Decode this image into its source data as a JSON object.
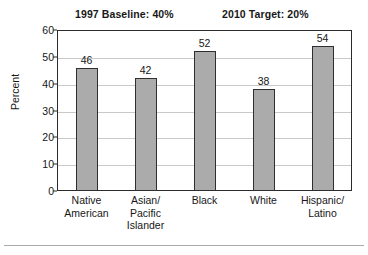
{
  "headers": {
    "baseline": "1997 Baseline: 40%",
    "target": "2010 Target: 20%"
  },
  "axis": {
    "ylabel": "Percent",
    "yticks": [
      "0",
      "10",
      "20",
      "30",
      "40",
      "50",
      "60"
    ]
  },
  "chart_data": {
    "type": "bar",
    "title": "",
    "subtitle": "",
    "annotations": [
      "1997 Baseline: 40%",
      "2010 Target: 20%"
    ],
    "categories": [
      "Native American",
      "Asian/ Pacific Islander",
      "Black",
      "White",
      "Hispanic/ Latino"
    ],
    "category_lines": [
      [
        "Native",
        "American"
      ],
      [
        "Asian/",
        "Pacific",
        "Islander"
      ],
      [
        "Black"
      ],
      [
        "White"
      ],
      [
        "Hispanic/",
        "Latino"
      ]
    ],
    "values": [
      46,
      42,
      52,
      38,
      54
    ],
    "xlabel": "",
    "ylabel": "Percent",
    "ylim": [
      0,
      60
    ],
    "ytick_step": 10,
    "grid": true,
    "legend": "none",
    "bar_color": "#ababab",
    "bar_edge_color": "#2f2f2f",
    "grid_color": "#c9c9c9",
    "frame_color": "#2b2b2b"
  }
}
